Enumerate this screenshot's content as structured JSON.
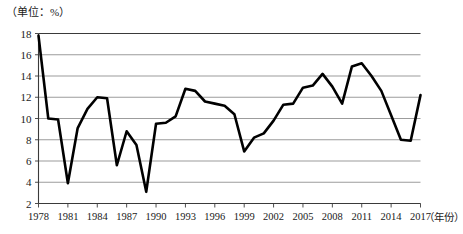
{
  "figure": {
    "unit_label": "（单位：%）",
    "xaxis_title": "（年份）"
  },
  "chart_data": {
    "type": "line",
    "title": "",
    "subtitle": "",
    "xlabel": "（年份）",
    "ylabel": "（单位：%）",
    "unit": "%",
    "grid": true,
    "legend": false,
    "legend_position": "none",
    "xlim": [
      1978,
      2017
    ],
    "ylim": [
      2,
      18
    ],
    "ytick_step": 2,
    "yticks": [
      2,
      4,
      6,
      8,
      10,
      12,
      14,
      16,
      18
    ],
    "ytick_labels": [
      "2",
      "4",
      "6",
      "8",
      "10",
      "12",
      "14",
      "16",
      "18"
    ],
    "xticks": [
      1978,
      1981,
      1984,
      1987,
      1990,
      1993,
      1996,
      1999,
      2002,
      2005,
      2008,
      2011,
      2014,
      2017
    ],
    "xtick_labels": [
      "1978",
      "1981",
      "1984",
      "1987",
      "1990",
      "1993",
      "1996",
      "1999",
      "2002",
      "2005",
      "2008",
      "2011",
      "2014",
      "2017"
    ],
    "x": [
      1978,
      1979,
      1980,
      1981,
      1982,
      1983,
      1984,
      1985,
      1986,
      1987,
      1988,
      1989,
      1990,
      1991,
      1992,
      1993,
      1994,
      1995,
      1996,
      1997,
      1998,
      1999,
      2000,
      2001,
      2002,
      2003,
      2004,
      2005,
      2006,
      2007,
      2008,
      2009,
      2010,
      2011,
      2012,
      2013,
      2014,
      2015,
      2016,
      2017
    ],
    "categories": [
      "1978",
      "1979",
      "1980",
      "1981",
      "1982",
      "1983",
      "1984",
      "1985",
      "1986",
      "1987",
      "1988",
      "1989",
      "1990",
      "1991",
      "1992",
      "1993",
      "1994",
      "1995",
      "1996",
      "1997",
      "1998",
      "1999",
      "2000",
      "2001",
      "2002",
      "2003",
      "2004",
      "2005",
      "2006",
      "2007",
      "2008",
      "2009",
      "2010",
      "2011",
      "2012",
      "2013",
      "2014",
      "2015",
      "2016",
      "2017"
    ],
    "values": [
      17.8,
      10.0,
      9.9,
      3.9,
      9.1,
      10.9,
      12.0,
      11.9,
      5.6,
      8.8,
      7.5,
      3.1,
      9.5,
      9.6,
      10.2,
      12.8,
      12.6,
      11.6,
      11.4,
      11.2,
      10.4,
      6.9,
      8.2,
      8.6,
      9.8,
      11.3,
      11.4,
      12.9,
      13.1,
      14.2,
      13.0,
      11.4,
      14.9,
      15.2,
      14.0,
      12.6,
      10.3,
      8.0,
      7.9,
      12.2
    ],
    "series": [
      {
        "name": "增长率",
        "color": "#000000",
        "line_width": 2.6,
        "values": [
          17.8,
          10.0,
          9.9,
          3.9,
          9.1,
          10.9,
          12.0,
          11.9,
          5.6,
          8.8,
          7.5,
          3.1,
          9.5,
          9.6,
          10.2,
          12.8,
          12.6,
          11.6,
          11.4,
          11.2,
          10.4,
          6.9,
          8.2,
          8.6,
          9.8,
          11.3,
          11.4,
          12.9,
          13.1,
          14.2,
          13.0,
          11.4,
          14.9,
          15.2,
          14.0,
          12.6,
          10.3,
          8.0,
          7.9,
          12.2
        ]
      }
    ],
    "annotations": []
  },
  "style": {
    "line_color": "#000000",
    "grid_color": "#8a8a8a",
    "axis_color": "#3a3a3a",
    "background": "#ffffff"
  }
}
